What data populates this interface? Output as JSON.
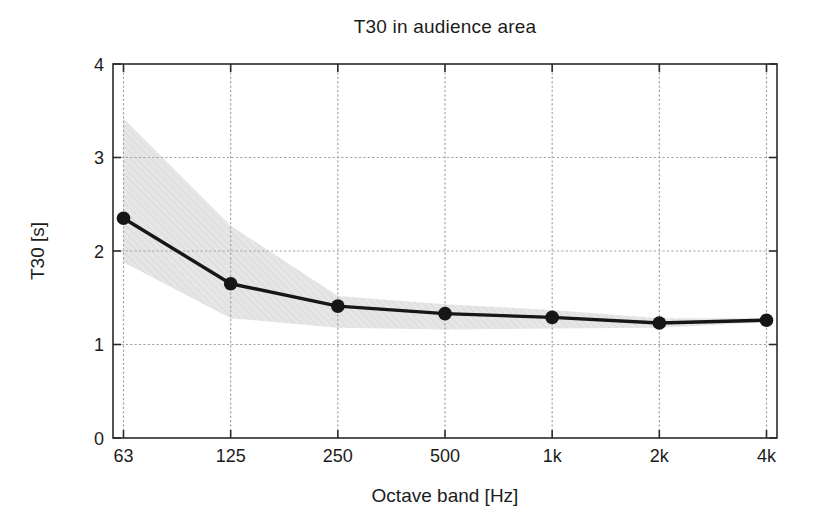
{
  "figure": {
    "title": "T30 in audience area",
    "xlabel": "Octave band [Hz]",
    "ylabel": "T30 [s]"
  },
  "chart_data": {
    "type": "line",
    "title": "T30 in audience area",
    "xlabel": "Octave band [Hz]",
    "ylabel": "T30 [s]",
    "categories": [
      "63",
      "125",
      "250",
      "500",
      "1k",
      "2k",
      "4k"
    ],
    "series": [
      {
        "name": "T30 mean",
        "values": [
          2.35,
          1.65,
          1.41,
          1.33,
          1.29,
          1.23,
          1.26
        ]
      },
      {
        "name": "spread upper bound",
        "values": [
          3.42,
          2.27,
          1.52,
          1.43,
          1.37,
          1.28,
          1.28
        ]
      },
      {
        "name": "spread lower bound",
        "values": [
          1.88,
          1.28,
          1.18,
          1.16,
          1.17,
          1.18,
          1.24
        ]
      }
    ],
    "ytick_labels": [
      "0",
      "1",
      "2",
      "3",
      "4"
    ],
    "yticks": [
      0,
      1,
      2,
      3,
      4
    ],
    "ylim": [
      0,
      4
    ],
    "grid": "dotted",
    "legend": "none",
    "marker": "filled-circle",
    "colors": {
      "line": "#161616",
      "marker": "#161616",
      "band": "#e6e6e6",
      "band_hatch": "#d9d9d9",
      "grid": "#a3a3a3",
      "axis": "#2b2b2b",
      "text": "#1c1c1c",
      "background": "#ffffff"
    }
  }
}
